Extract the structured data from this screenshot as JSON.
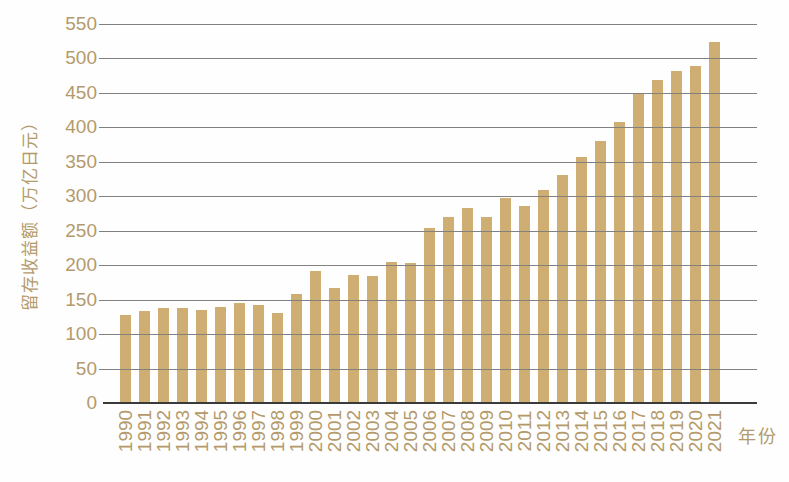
{
  "chart_data": {
    "type": "bar",
    "title": "",
    "ylabel": "留存收益额（万亿日元）",
    "xlabel": "年份",
    "categories": [
      "1990",
      "1991",
      "1992",
      "1993",
      "1994",
      "1995",
      "1996",
      "1997",
      "1998",
      "1999",
      "2000",
      "2001",
      "2002",
      "2003",
      "2004",
      "2005",
      "2006",
      "2007",
      "2008",
      "2009",
      "2010",
      "2011",
      "2012",
      "2013",
      "2014",
      "2015",
      "2016",
      "2017",
      "2018",
      "2019",
      "2020",
      "2021"
    ],
    "values": [
      127,
      133,
      138,
      138,
      135,
      139,
      145,
      142,
      131,
      158,
      192,
      167,
      186,
      184,
      204,
      203,
      254,
      270,
      283,
      270,
      297,
      286,
      309,
      331,
      357,
      380,
      407,
      450,
      469,
      481,
      489,
      523
    ],
    "ylim": [
      0,
      550
    ],
    "ytick_step": 50,
    "yticks": [
      0,
      50,
      100,
      150,
      200,
      250,
      300,
      350,
      400,
      450,
      500,
      550
    ],
    "grid": true,
    "legend": null,
    "colors": {
      "bar": "#cfae73",
      "label": "#b49a6b",
      "gridline": "#818181",
      "baseline": "#3a3a3a",
      "background": "#fefefe"
    }
  }
}
